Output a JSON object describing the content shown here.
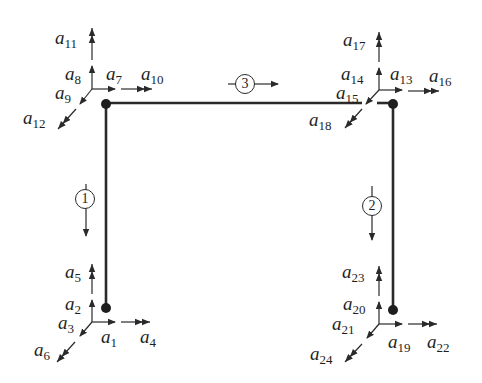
{
  "diagram": {
    "type": "portal frame degrees of freedom",
    "members": [
      {
        "id": "1",
        "label": "1"
      },
      {
        "id": "2",
        "label": "2"
      },
      {
        "id": "3",
        "label": "3"
      }
    ],
    "node_labels": {
      "bottom_left": [
        {
          "sym": "a",
          "sub": "1"
        },
        {
          "sym": "a",
          "sub": "2"
        },
        {
          "sym": "a",
          "sub": "3"
        },
        {
          "sym": "a",
          "sub": "4"
        },
        {
          "sym": "a",
          "sub": "5"
        },
        {
          "sym": "a",
          "sub": "6"
        }
      ],
      "top_left": [
        {
          "sym": "a",
          "sub": "7"
        },
        {
          "sym": "a",
          "sub": "8"
        },
        {
          "sym": "a",
          "sub": "9"
        },
        {
          "sym": "a",
          "sub": "10"
        },
        {
          "sym": "a",
          "sub": "11"
        },
        {
          "sym": "a",
          "sub": "12"
        }
      ],
      "top_right": [
        {
          "sym": "a",
          "sub": "13"
        },
        {
          "sym": "a",
          "sub": "14"
        },
        {
          "sym": "a",
          "sub": "15"
        },
        {
          "sym": "a",
          "sub": "16"
        },
        {
          "sym": "a",
          "sub": "17"
        },
        {
          "sym": "a",
          "sub": "18"
        }
      ],
      "bottom_right": [
        {
          "sym": "a",
          "sub": "19"
        },
        {
          "sym": "a",
          "sub": "20"
        },
        {
          "sym": "a",
          "sub": "21"
        },
        {
          "sym": "a",
          "sub": "22"
        },
        {
          "sym": "a",
          "sub": "23"
        },
        {
          "sym": "a",
          "sub": "24"
        }
      ]
    },
    "colors": {
      "line": "#2a2a2a",
      "text": "#1e1e1e",
      "background": "#ffffff"
    }
  }
}
